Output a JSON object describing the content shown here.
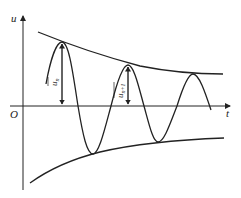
{
  "diagram": {
    "type": "damped-oscillation",
    "axes": {
      "y_label": "u",
      "x_label": "t",
      "origin_label": "O"
    },
    "annotations": {
      "amplitude_n": "u",
      "amplitude_n_sub": "n",
      "amplitude_n1": "u",
      "amplitude_n1_sub": "n+1"
    },
    "geometry": {
      "u_axis_x": 23,
      "t_axis_y": 106,
      "peaks": [
        [
          62,
          42
        ],
        [
          128,
          65
        ],
        [
          193,
          74
        ]
      ],
      "troughs": [
        [
          93,
          154
        ],
        [
          158,
          142
        ]
      ],
      "zero_crossings": [
        78,
        111,
        144,
        177
      ]
    },
    "color": "#222222"
  }
}
